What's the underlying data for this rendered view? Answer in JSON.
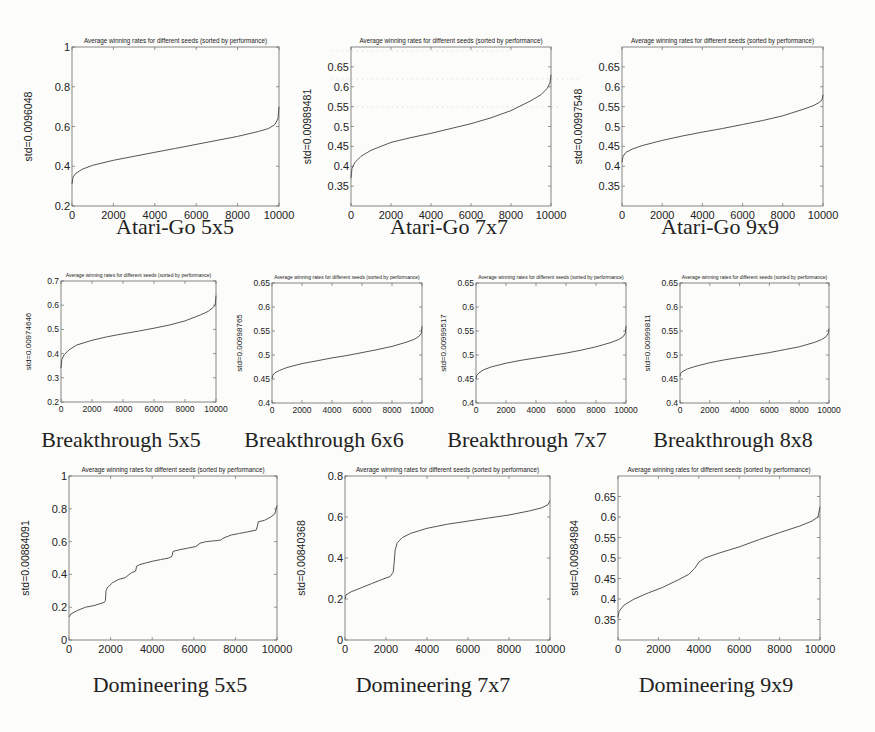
{
  "figure": {
    "chart_title_common": "Average winning rates for different seeds (sorted by performance)",
    "line_color": "#555555",
    "frame_color": "#6a6a6a"
  },
  "captions": [
    "Atari-Go 5x5",
    "Atari-Go 7x7",
    "Atari-Go 9x9",
    "Breakthrough 5x5",
    "Breakthrough 6x6",
    "Breakthrough 7x7",
    "Breakthrough 8x8",
    "Domineering 5x5",
    "Domineering 7x7",
    "Domineering 9x9"
  ],
  "chart_data": [
    {
      "id": "atari-go-5x5",
      "type": "line",
      "title": "Average winning rates for different seeds (sorted by performance)",
      "caption": "Atari-Go 5x5",
      "xlabel": "",
      "ylabel": "std=0.0096048",
      "xlim": [
        0,
        10000
      ],
      "ylim": [
        0.2,
        1.0
      ],
      "xticks": [
        0,
        2000,
        4000,
        6000,
        8000,
        10000
      ],
      "yticks": [
        0.2,
        0.4,
        0.6,
        0.8,
        1
      ],
      "ytick_labels": [
        "0.2",
        "0.4",
        "0.6",
        "0.8",
        "1"
      ],
      "grid": false,
      "x": [
        0,
        50,
        200,
        500,
        1000,
        2000,
        3000,
        4000,
        5000,
        6000,
        7000,
        8000,
        9000,
        9500,
        9800,
        9950,
        10000
      ],
      "y": [
        0.31,
        0.345,
        0.365,
        0.385,
        0.405,
        0.43,
        0.45,
        0.47,
        0.49,
        0.51,
        0.53,
        0.55,
        0.575,
        0.59,
        0.61,
        0.64,
        0.7
      ]
    },
    {
      "id": "atari-go-7x7",
      "type": "line",
      "title": "Average winning rates for different seeds (sorted by performance)",
      "caption": "Atari-Go 7x7",
      "xlabel": "",
      "ylabel": "std=0.00989481",
      "xlim": [
        0,
        10000
      ],
      "ylim": [
        0.3,
        0.7
      ],
      "xticks": [
        0,
        2000,
        4000,
        6000,
        8000,
        10000
      ],
      "yticks": [
        0.35,
        0.4,
        0.45,
        0.5,
        0.55,
        0.6,
        0.65
      ],
      "ytick_labels": [
        "0.35",
        "0.4",
        "0.45",
        "0.5",
        "0.55",
        "0.6",
        "0.65"
      ],
      "grid": false,
      "x": [
        0,
        50,
        200,
        500,
        1000,
        2000,
        3000,
        4000,
        5000,
        6000,
        7000,
        8000,
        9000,
        9500,
        9800,
        9950,
        10000
      ],
      "y": [
        0.37,
        0.395,
        0.41,
        0.425,
        0.44,
        0.46,
        0.472,
        0.483,
        0.495,
        0.507,
        0.522,
        0.54,
        0.565,
        0.58,
        0.595,
        0.61,
        0.63
      ]
    },
    {
      "id": "atari-go-9x9",
      "type": "line",
      "title": "Average winning rates for different seeds (sorted by performance)",
      "caption": "Atari-Go 9x9",
      "xlabel": "",
      "ylabel": "std=0.00997548",
      "xlim": [
        0,
        10000
      ],
      "ylim": [
        0.3,
        0.7
      ],
      "xticks": [
        0,
        2000,
        4000,
        6000,
        8000,
        10000
      ],
      "yticks": [
        0.35,
        0.4,
        0.45,
        0.5,
        0.55,
        0.6,
        0.65
      ],
      "ytick_labels": [
        "0.35",
        "0.4",
        "0.45",
        "0.5",
        "0.55",
        "0.6",
        "0.65"
      ],
      "grid": false,
      "x": [
        0,
        50,
        200,
        500,
        1000,
        2000,
        3000,
        4000,
        5000,
        6000,
        7000,
        8000,
        9000,
        9500,
        9800,
        9950,
        10000
      ],
      "y": [
        0.41,
        0.425,
        0.435,
        0.443,
        0.452,
        0.465,
        0.476,
        0.486,
        0.495,
        0.505,
        0.515,
        0.527,
        0.543,
        0.552,
        0.56,
        0.567,
        0.58
      ]
    },
    {
      "id": "breakthrough-5x5",
      "type": "line",
      "title": "Average winning rates for different seeds (sorted by performance)",
      "caption": "Breakthrough 5x5",
      "xlabel": "",
      "ylabel": "std=0.00974646",
      "xlim": [
        0,
        10000
      ],
      "ylim": [
        0.2,
        0.7
      ],
      "xticks": [
        0,
        2000,
        4000,
        6000,
        8000,
        10000
      ],
      "yticks": [
        0.2,
        0.3,
        0.4,
        0.5,
        0.6,
        0.7
      ],
      "ytick_labels": [
        "0.2",
        "0.3",
        "0.4",
        "0.5",
        "0.6",
        "0.7"
      ],
      "grid": false,
      "x": [
        0,
        50,
        200,
        500,
        1000,
        2000,
        3000,
        4000,
        5000,
        6000,
        7000,
        8000,
        9000,
        9500,
        9800,
        9950,
        10000
      ],
      "y": [
        0.34,
        0.375,
        0.395,
        0.415,
        0.435,
        0.455,
        0.47,
        0.482,
        0.493,
        0.505,
        0.518,
        0.535,
        0.56,
        0.575,
        0.59,
        0.6,
        0.64
      ]
    },
    {
      "id": "breakthrough-6x6",
      "type": "line",
      "title": "Average winning rates for different seeds (sorted by performance)",
      "caption": "Breakthrough 6x6",
      "xlabel": "",
      "ylabel": "std=0.00998765",
      "xlim": [
        0,
        10000
      ],
      "ylim": [
        0.4,
        0.65
      ],
      "xticks": [
        0,
        2000,
        4000,
        6000,
        8000,
        10000
      ],
      "yticks": [
        0.4,
        0.45,
        0.5,
        0.55,
        0.6,
        0.65
      ],
      "ytick_labels": [
        "0.4",
        "0.45",
        "0.5",
        "0.55",
        "0.6",
        "0.65"
      ],
      "grid": false,
      "x": [
        0,
        50,
        200,
        500,
        1000,
        2000,
        3000,
        4000,
        5000,
        6000,
        7000,
        8000,
        9000,
        9500,
        9800,
        9950,
        10000
      ],
      "y": [
        0.45,
        0.458,
        0.463,
        0.468,
        0.474,
        0.482,
        0.488,
        0.494,
        0.499,
        0.505,
        0.511,
        0.518,
        0.527,
        0.533,
        0.539,
        0.545,
        0.56
      ]
    },
    {
      "id": "breakthrough-7x7",
      "type": "line",
      "title": "Average winning rates for different seeds (sorted by performance)",
      "caption": "Breakthrough 7x7",
      "xlabel": "",
      "ylabel": "std=0.00999517",
      "xlim": [
        0,
        10000
      ],
      "ylim": [
        0.4,
        0.65
      ],
      "xticks": [
        0,
        2000,
        4000,
        6000,
        8000,
        10000
      ],
      "yticks": [
        0.4,
        0.45,
        0.5,
        0.55,
        0.6,
        0.65
      ],
      "ytick_labels": [
        "0.4",
        "0.45",
        "0.5",
        "0.55",
        "0.6",
        "0.65"
      ],
      "grid": false,
      "x": [
        0,
        50,
        200,
        500,
        1000,
        2000,
        3000,
        4000,
        5000,
        6000,
        7000,
        8000,
        9000,
        9500,
        9800,
        9950,
        10000
      ],
      "y": [
        0.45,
        0.458,
        0.463,
        0.469,
        0.475,
        0.483,
        0.489,
        0.494,
        0.499,
        0.504,
        0.51,
        0.517,
        0.526,
        0.532,
        0.538,
        0.545,
        0.56
      ]
    },
    {
      "id": "breakthrough-8x8",
      "type": "line",
      "title": "Average winning rates for different seeds (sorted by performance)",
      "caption": "Breakthrough 8x8",
      "xlabel": "",
      "ylabel": "std=0.00999811",
      "xlim": [
        0,
        10000
      ],
      "ylim": [
        0.4,
        0.65
      ],
      "xticks": [
        0,
        2000,
        4000,
        6000,
        8000,
        10000
      ],
      "yticks": [
        0.4,
        0.45,
        0.5,
        0.55,
        0.6,
        0.65
      ],
      "ytick_labels": [
        "0.4",
        "0.45",
        "0.5",
        "0.55",
        "0.6",
        "0.65"
      ],
      "grid": false,
      "x": [
        0,
        50,
        200,
        500,
        1000,
        2000,
        3000,
        4000,
        5000,
        6000,
        7000,
        8000,
        9000,
        9500,
        9800,
        9950,
        10000
      ],
      "y": [
        0.455,
        0.462,
        0.466,
        0.471,
        0.476,
        0.484,
        0.49,
        0.495,
        0.5,
        0.505,
        0.511,
        0.517,
        0.526,
        0.532,
        0.538,
        0.545,
        0.555
      ]
    },
    {
      "id": "domineering-5x5",
      "type": "line",
      "title": "Average winning rates for different seeds (sorted by performance)",
      "caption": "Domineering 5x5",
      "xlabel": "",
      "ylabel": "std=0.00884091",
      "xlim": [
        0,
        10000
      ],
      "ylim": [
        0,
        1
      ],
      "xticks": [
        0,
        2000,
        4000,
        6000,
        8000,
        10000
      ],
      "yticks": [
        0,
        0.2,
        0.4,
        0.6,
        0.8,
        1
      ],
      "ytick_labels": [
        "0",
        "0.2",
        "0.4",
        "0.6",
        "0.8",
        "1"
      ],
      "grid": false,
      "x": [
        0,
        100,
        400,
        800,
        1200,
        1700,
        1750,
        1780,
        1850,
        2100,
        2400,
        2700,
        2800,
        3000,
        3200,
        3250,
        3400,
        3700,
        4000,
        4400,
        4800,
        4950,
        5000,
        5300,
        5700,
        6100,
        6200,
        6300,
        6600,
        7000,
        7300,
        7400,
        7800,
        8200,
        8600,
        9000,
        9050,
        9100,
        9400,
        9700,
        9900,
        10000
      ],
      "y": [
        0.14,
        0.16,
        0.18,
        0.2,
        0.21,
        0.23,
        0.24,
        0.3,
        0.32,
        0.35,
        0.37,
        0.38,
        0.39,
        0.41,
        0.42,
        0.45,
        0.46,
        0.47,
        0.48,
        0.49,
        0.5,
        0.51,
        0.54,
        0.55,
        0.56,
        0.57,
        0.58,
        0.59,
        0.6,
        0.605,
        0.61,
        0.62,
        0.64,
        0.65,
        0.66,
        0.67,
        0.69,
        0.72,
        0.73,
        0.75,
        0.77,
        0.82
      ]
    },
    {
      "id": "domineering-7x7",
      "type": "line",
      "title": "Average winning rates for different seeds (sorted by performance)",
      "caption": "Domineering 7x7",
      "xlabel": "",
      "ylabel": "std=0.00840368",
      "xlim": [
        0,
        10000
      ],
      "ylim": [
        0,
        0.8
      ],
      "xticks": [
        0,
        2000,
        4000,
        6000,
        8000,
        10000
      ],
      "yticks": [
        0,
        0.2,
        0.4,
        0.6,
        0.8
      ],
      "ytick_labels": [
        "0",
        "0.2",
        "0.4",
        "0.6",
        "0.8"
      ],
      "grid": false,
      "x": [
        0,
        50,
        300,
        800,
        1300,
        1800,
        2200,
        2350,
        2400,
        2450,
        2550,
        2800,
        3200,
        4000,
        5000,
        6000,
        7000,
        8000,
        9000,
        9600,
        9900,
        10000
      ],
      "y": [
        0.2,
        0.22,
        0.235,
        0.255,
        0.275,
        0.295,
        0.31,
        0.33,
        0.38,
        0.44,
        0.475,
        0.5,
        0.52,
        0.545,
        0.565,
        0.58,
        0.595,
        0.61,
        0.63,
        0.645,
        0.66,
        0.68
      ]
    },
    {
      "id": "domineering-9x9",
      "type": "line",
      "title": "Average winning rates for different seeds (sorted by performance)",
      "caption": "Domineering 9x9",
      "xlabel": "",
      "ylabel": "std=0.00984984",
      "xlim": [
        0,
        10000
      ],
      "ylim": [
        0.3,
        0.7
      ],
      "xticks": [
        0,
        2000,
        4000,
        6000,
        8000,
        10000
      ],
      "yticks": [
        0.35,
        0.4,
        0.45,
        0.5,
        0.55,
        0.6,
        0.65
      ],
      "ytick_labels": [
        "0.35",
        "0.4",
        "0.45",
        "0.5",
        "0.55",
        "0.6",
        "0.65"
      ],
      "grid": false,
      "x": [
        0,
        50,
        300,
        800,
        1500,
        2200,
        3000,
        3500,
        3800,
        4000,
        4300,
        5000,
        6000,
        7000,
        8000,
        9000,
        9600,
        9900,
        10000
      ],
      "y": [
        0.355,
        0.37,
        0.385,
        0.4,
        0.415,
        0.428,
        0.447,
        0.46,
        0.475,
        0.49,
        0.5,
        0.512,
        0.527,
        0.545,
        0.562,
        0.578,
        0.59,
        0.6,
        0.625
      ]
    }
  ]
}
